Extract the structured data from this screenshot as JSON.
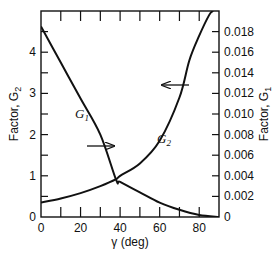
{
  "chart_data": {
    "type": "line",
    "title": "",
    "xlabel": "γ (deg)",
    "ylabel_left": "Factor, G2",
    "ylabel_right": "Factor, G1",
    "xlim": [
      0,
      90
    ],
    "ylim_left": [
      0,
      5
    ],
    "ylim_right": [
      0,
      0.02
    ],
    "x_ticks": [
      0,
      20,
      40,
      60,
      80
    ],
    "x_minor_ticks": [
      10,
      30,
      50,
      70,
      90
    ],
    "y_left_ticks": [
      0,
      1,
      2,
      3,
      4
    ],
    "y_left_minor_ticks": [
      0.5,
      1.5,
      2.5,
      3.5,
      4.5
    ],
    "y_right_ticks": [
      0,
      0.002,
      0.004,
      0.006,
      0.008,
      0.01,
      0.012,
      0.014,
      0.016,
      0.018
    ],
    "grid": false,
    "legend": "none (curves labeled inline with arrows indicating axis)",
    "series": [
      {
        "name": "G1",
        "axis": "right",
        "x": [
          0,
          10,
          20,
          30,
          38,
          40,
          50,
          60,
          70,
          80,
          90
        ],
        "values": [
          0.0185,
          0.015,
          0.0115,
          0.008,
          0.0036,
          0.0034,
          0.0024,
          0.0014,
          0.0007,
          0.0002,
          0.0
        ]
      },
      {
        "name": "G2",
        "axis": "left",
        "x": [
          0,
          10,
          20,
          30,
          38,
          40,
          50,
          60,
          70,
          75,
          80,
          85,
          87
        ],
        "values": [
          0.35,
          0.45,
          0.58,
          0.75,
          0.92,
          1.0,
          1.3,
          1.85,
          2.9,
          3.8,
          4.4,
          4.9,
          5.0
        ]
      }
    ],
    "annotations": [
      {
        "text": "G1",
        "arrow": "right",
        "meaning": "G1 read on right axis"
      },
      {
        "text": "G2",
        "arrow": "left",
        "meaning": "G2 read on left axis"
      }
    ]
  },
  "labels": {
    "x_axis_title": "γ (deg)",
    "y_left_title": "Factor, G",
    "y_left_sub": "2",
    "y_right_title": "Factor, G",
    "y_right_sub": "1",
    "g1_label": "G",
    "g1_sub": "1",
    "g2_label": "G",
    "g2_sub": "2",
    "x_tick_labels": [
      "0",
      "20",
      "40",
      "60",
      "80"
    ],
    "y_left_tick_labels": [
      "0",
      "1",
      "2",
      "3",
      "4"
    ],
    "y_right_tick_labels": [
      "0",
      "0.002",
      "0.004",
      "0.006",
      "0.008",
      "0.010",
      "0.012",
      "0.014",
      "0.016",
      "0.018"
    ]
  }
}
